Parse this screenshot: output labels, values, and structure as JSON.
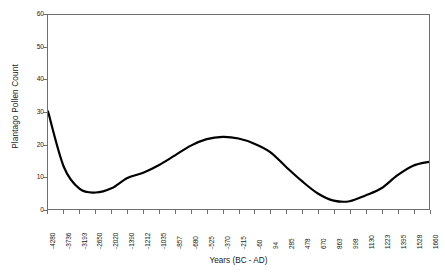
{
  "chart_data": {
    "type": "line",
    "title": "",
    "xlabel": "Years (BC - AD)",
    "ylabel": "Plantago Pollen Count",
    "ylim": [
      0,
      60
    ],
    "yticks": [
      0,
      10,
      20,
      30,
      40,
      50,
      60
    ],
    "grid": false,
    "legend": false,
    "legend_position": "none",
    "line_color": "#000000",
    "line_width": 2.2,
    "frame_color": "#6e6e6e",
    "background": "#ffffff",
    "categories": [
      "-4280",
      "-3736",
      "-3193",
      "-2650",
      "-2020",
      "-1390",
      "-1212",
      "-1035",
      "-857",
      "-680",
      "-525",
      "-370",
      "-215",
      "-60",
      "94",
      "285",
      "478",
      "670",
      "863",
      "998",
      "1130",
      "1223",
      "1395",
      "1528",
      "1660"
    ],
    "values": [
      30.2,
      13.0,
      6.2,
      5.1,
      6.4,
      9.6,
      11.2,
      13.6,
      16.6,
      19.6,
      21.6,
      22.3,
      21.8,
      20.2,
      17.6,
      13.0,
      8.6,
      4.8,
      2.6,
      2.4,
      4.2,
      6.4,
      10.4,
      13.4,
      14.6
    ],
    "series": [
      {
        "name": "Plantago pollen count",
        "values": [
          30.2,
          13.0,
          6.2,
          5.1,
          6.4,
          9.6,
          11.2,
          13.6,
          16.6,
          19.6,
          21.6,
          22.3,
          21.8,
          20.2,
          17.6,
          13.0,
          8.6,
          4.8,
          2.6,
          2.4,
          4.2,
          6.4,
          10.4,
          13.4,
          14.6
        ]
      }
    ]
  }
}
